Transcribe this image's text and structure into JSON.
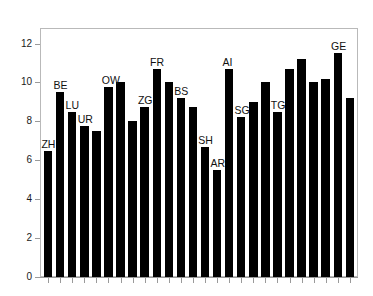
{
  "chart_data": {
    "type": "bar",
    "title": "",
    "subtitle": "",
    "xlabel": "",
    "ylabel": "",
    "ylim": [
      0,
      12.8
    ],
    "xlim": [
      0,
      26
    ],
    "grid": false,
    "legend": null,
    "legend_position": "none",
    "y_ticks": [
      0,
      2,
      4,
      6,
      8,
      10,
      12
    ],
    "y_tick_labels": [
      "0",
      "2",
      "4",
      "6",
      "8",
      "10",
      "12"
    ],
    "x_tick_labels": [],
    "n_bars": 26,
    "bar_color": "#000000",
    "categories": [
      "ZH",
      "BE",
      "LU",
      "UR",
      "SZ",
      "OW",
      "NW",
      "GL",
      "ZG",
      "FR",
      "SO",
      "BS",
      "BL",
      "SH",
      "AR",
      "AI",
      "SG",
      "GR",
      "AG",
      "TG",
      "TI",
      "VD",
      "VS",
      "NE",
      "GE",
      "JU"
    ],
    "values": [
      6.5,
      9.5,
      8.5,
      7.75,
      7.5,
      9.75,
      10.0,
      8.0,
      8.75,
      10.7,
      10.0,
      9.2,
      8.75,
      6.7,
      5.5,
      10.7,
      8.2,
      9.0,
      10.0,
      8.5,
      10.7,
      11.2,
      10.0,
      10.2,
      11.5,
      9.2
    ],
    "annotations": [
      {
        "text": "ZH",
        "bar_index": 0,
        "value": 6.5
      },
      {
        "text": "BE",
        "bar_index": 1,
        "value": 9.5
      },
      {
        "text": "LU",
        "bar_index": 2,
        "value": 8.5
      },
      {
        "text": "UR",
        "bar_index": 3,
        "value": 7.75
      },
      {
        "text": "OW",
        "bar_index": 5,
        "value": 9.75
      },
      {
        "text": "ZG",
        "bar_index": 8,
        "value": 8.75
      },
      {
        "text": "FR",
        "bar_index": 9,
        "value": 10.7
      },
      {
        "text": "BS",
        "bar_index": 11,
        "value": 9.2
      },
      {
        "text": "SH",
        "bar_index": 13,
        "value": 6.7
      },
      {
        "text": "AR",
        "bar_index": 14,
        "value": 5.5
      },
      {
        "text": "AI",
        "bar_index": 15,
        "value": 10.7
      },
      {
        "text": "SG",
        "bar_index": 16,
        "value": 8.2
      },
      {
        "text": "TG",
        "bar_index": 19,
        "value": 8.5
      },
      {
        "text": "GE",
        "bar_index": 24,
        "value": 11.5
      }
    ]
  },
  "figure": {
    "background": "#ffffff",
    "frame_color": "#b9b9b9",
    "axis_color": "#9a9a9a",
    "text_color": "#111111"
  }
}
